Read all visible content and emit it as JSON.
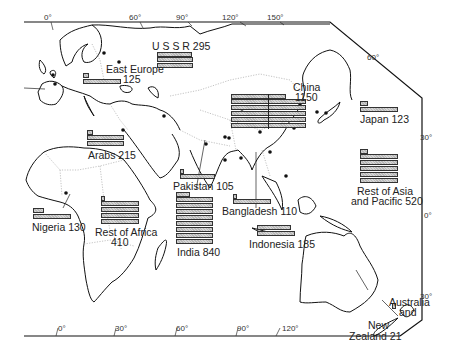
{
  "map": {
    "title": "Population by region (millions)",
    "graticule": {
      "top_longitudes": [
        "0°",
        "60°",
        "90°",
        "120°",
        "150°"
      ],
      "bottom_longitudes": [
        "0°",
        "30°",
        "60°",
        "90°",
        "120°"
      ],
      "right_latitudes": [
        "60°",
        "30°",
        "0°",
        "30°"
      ]
    },
    "regions": [
      {
        "name": "U S S R",
        "value": 295,
        "label": "U S S R 295"
      },
      {
        "name": "East Europe",
        "value": 125,
        "label_line1": "East Europe",
        "label_line2": "125"
      },
      {
        "name": "China",
        "value": 1150,
        "label_line1": "China",
        "label_line2": "1150"
      },
      {
        "name": "Japan",
        "value": 123,
        "label": "Japan 123"
      },
      {
        "name": "Arabs",
        "value": 215,
        "label": "Arabs 215"
      },
      {
        "name": "Pakistan",
        "value": 105,
        "label": "Pakistan 105"
      },
      {
        "name": "India",
        "value": 840,
        "label": "India 840"
      },
      {
        "name": "Bangladesh",
        "value": 110,
        "label": "Bangladesh 110"
      },
      {
        "name": "Rest of Asia and Pacific",
        "value": 520,
        "label_line1": "Rest of Asia",
        "label_line2": "and Pacific 520"
      },
      {
        "name": "Nigeria",
        "value": 130,
        "label": "Nigeria 130"
      },
      {
        "name": "Rest of Africa",
        "value": 410,
        "label_line1": "Rest of Africa",
        "label_line2": "410"
      },
      {
        "name": "Indonesia",
        "value": 185,
        "label": "Indonesia 185"
      },
      {
        "name": "Australia and New Zealand",
        "value": 21,
        "label_line1": "Australia",
        "label_line2": "and",
        "label_line3": "New",
        "label_line4": "Zealand 21"
      }
    ]
  },
  "colors": {
    "coast": "#111111",
    "border": "#9a9a9a",
    "bar_fill": "#c8c8c8",
    "bar_stroke": "#333333"
  }
}
